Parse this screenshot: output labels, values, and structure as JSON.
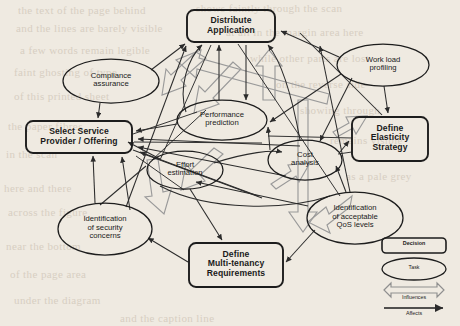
{
  "diagram": {
    "background_color": "#efeae1",
    "stroke_color": "#2b2b2b",
    "influence_color": "#8f8f8f",
    "decisions": [
      {
        "id": "distribute-application",
        "label_lines": [
          "Distribute",
          "Application"
        ],
        "x": 187,
        "y": 10,
        "w": 88,
        "h": 32
      },
      {
        "id": "select-service-provider",
        "label_lines": [
          "Select Service",
          "Provider / Offering"
        ],
        "x": 26,
        "y": 121,
        "w": 106,
        "h": 32
      },
      {
        "id": "define-elasticity-strategy",
        "label_lines": [
          "Define",
          "Elasticity",
          "Strategy"
        ],
        "x": 352,
        "y": 117,
        "w": 76,
        "h": 44
      },
      {
        "id": "define-multi-tenancy-requirements",
        "label_lines": [
          "Define",
          "Multi-tenancy",
          "Requirements"
        ],
        "x": 189,
        "y": 243,
        "w": 94,
        "h": 44
      }
    ],
    "tasks": [
      {
        "id": "compliance-assurance",
        "label_lines": [
          "Compliance",
          "assurance"
        ],
        "cx": 111,
        "cy": 81,
        "rx": 48,
        "ry": 22
      },
      {
        "id": "work-load-profiling",
        "label_lines": [
          "Work load",
          "profiling"
        ],
        "cx": 383,
        "cy": 65,
        "rx": 46,
        "ry": 21
      },
      {
        "id": "performance-prediction",
        "label_lines": [
          "Performance",
          "prediction"
        ],
        "cx": 222,
        "cy": 120,
        "rx": 45,
        "ry": 20
      },
      {
        "id": "effort-estimation",
        "label_lines": [
          "Effort",
          "estimation"
        ],
        "cx": 185,
        "cy": 170,
        "rx": 38,
        "ry": 19
      },
      {
        "id": "cost-analysis",
        "label_lines": [
          "Cost",
          "analysis"
        ],
        "cx": 305,
        "cy": 160,
        "rx": 37,
        "ry": 20
      },
      {
        "id": "identification-of-security-concerns",
        "label_lines": [
          "Identification",
          "of security",
          "concerns"
        ],
        "cx": 105,
        "cy": 229,
        "rx": 47,
        "ry": 26
      },
      {
        "id": "identification-of-acceptable-qos-levels",
        "label_lines": [
          "Identification",
          "of acceptable",
          "QoS levels"
        ],
        "cx": 355,
        "cy": 218,
        "rx": 48,
        "ry": 26
      }
    ],
    "legend": {
      "decision_label": "Decision",
      "task_label": "Task",
      "influences_label": "Influences",
      "affects_label": "Affects"
    },
    "edges": [
      {
        "from": "compliance-assurance",
        "to": "select-service-provider",
        "type": "affects"
      },
      {
        "from": "compliance-assurance",
        "to": "distribute-application",
        "type": "affects"
      },
      {
        "from": "work-load-profiling",
        "to": "define-elasticity-strategy",
        "type": "affects"
      },
      {
        "from": "work-load-profiling",
        "to": "distribute-application",
        "type": "affects"
      },
      {
        "from": "work-load-profiling",
        "to": "performance-prediction",
        "type": "affects"
      },
      {
        "from": "work-load-profiling",
        "to": "cost-analysis",
        "type": "affects"
      },
      {
        "from": "performance-prediction",
        "to": "distribute-application",
        "type": "affects"
      },
      {
        "from": "performance-prediction",
        "to": "select-service-provider",
        "type": "affects"
      },
      {
        "from": "cost-analysis",
        "to": "distribute-application",
        "type": "affects"
      },
      {
        "from": "cost-analysis",
        "to": "define-elasticity-strategy",
        "type": "affects"
      },
      {
        "from": "effort-estimation",
        "to": "select-service-provider",
        "type": "affects"
      },
      {
        "from": "effort-estimation",
        "to": "define-multi-tenancy-requirements",
        "type": "affects"
      },
      {
        "from": "identification-of-security-concerns",
        "to": "select-service-provider",
        "type": "affects"
      },
      {
        "from": "identification-of-security-concerns",
        "to": "distribute-application",
        "type": "affects"
      },
      {
        "from": "identification-of-acceptable-qos-levels",
        "to": "define-multi-tenancy-requirements",
        "type": "affects"
      },
      {
        "from": "identification-of-acceptable-qos-levels",
        "to": "distribute-application",
        "type": "affects"
      },
      {
        "from": "distribute-application",
        "to": "performance-prediction",
        "type": "influences"
      },
      {
        "from": "distribute-application",
        "to": "select-service-provider",
        "type": "influences"
      },
      {
        "from": "distribute-application",
        "to": "define-multi-tenancy-requirements",
        "type": "influences"
      },
      {
        "from": "define-elasticity-strategy",
        "to": "cost-analysis",
        "type": "influences"
      },
      {
        "from": "define-multi-tenancy-requirements",
        "to": "effort-estimation",
        "type": "influences"
      },
      {
        "from": "select-service-provider",
        "to": "effort-estimation",
        "type": "influences"
      }
    ]
  },
  "page_bleed": [
    {
      "text": "the text of the page behind",
      "x": 18,
      "y": 4,
      "size": 11
    },
    {
      "text": "shows faintly through the scan",
      "x": 196,
      "y": 2,
      "size": 11
    },
    {
      "text": "and the lines are barely visible",
      "x": 16,
      "y": 22,
      "size": 11
    },
    {
      "text": "at all in the margin area here",
      "x": 226,
      "y": 26,
      "size": 11
    },
    {
      "text": "a few words remain legible",
      "x": 20,
      "y": 44,
      "size": 11
    },
    {
      "text": "while other parts are lost",
      "x": 250,
      "y": 52,
      "size": 11
    },
    {
      "text": "faint ghosting of type",
      "x": 14,
      "y": 66,
      "size": 11
    },
    {
      "text": "on the reverse side",
      "x": 276,
      "y": 78,
      "size": 11
    },
    {
      "text": "of this printed sheet",
      "x": 14,
      "y": 90,
      "size": 11
    },
    {
      "text": "showing through",
      "x": 300,
      "y": 104,
      "size": 11
    },
    {
      "text": "the paper fibres",
      "x": 8,
      "y": 120,
      "size": 11
    },
    {
      "text": "remains visible",
      "x": 330,
      "y": 134,
      "size": 11
    },
    {
      "text": "in the scan",
      "x": 6,
      "y": 148,
      "size": 11
    },
    {
      "text": "as a pale grey",
      "x": 346,
      "y": 170,
      "size": 11
    },
    {
      "text": "here and there",
      "x": 4,
      "y": 182,
      "size": 11
    },
    {
      "text": "across the figure",
      "x": 8,
      "y": 206,
      "size": 11
    },
    {
      "text": "near the bottom",
      "x": 6,
      "y": 240,
      "size": 11
    },
    {
      "text": "of the page area",
      "x": 10,
      "y": 268,
      "size": 11
    },
    {
      "text": "under the diagram",
      "x": 14,
      "y": 294,
      "size": 11
    },
    {
      "text": "and the caption line",
      "x": 120,
      "y": 312,
      "size": 11
    }
  ]
}
